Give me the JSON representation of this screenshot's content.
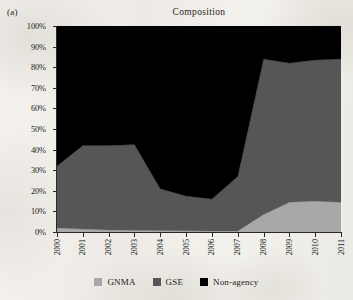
{
  "panel": {
    "label": "(a)"
  },
  "title": "Composition",
  "legend": {
    "items": [
      {
        "label": "GNMA",
        "color": "#a8a8a8",
        "swatch_name": "gnma-swatch"
      },
      {
        "label": "GSE",
        "color": "#565656",
        "swatch_name": "gse-swatch"
      },
      {
        "label": "Non-agency",
        "color": "#000000",
        "swatch_name": "non-agency-swatch"
      }
    ]
  },
  "axes": {
    "y": {
      "ticks": [
        "0%",
        "10%",
        "20%",
        "30%",
        "40%",
        "50%",
        "60%",
        "70%",
        "80%",
        "90%",
        "100%"
      ],
      "min": 0,
      "max": 100
    },
    "x": {
      "ticks": [
        "2000",
        "2001",
        "2002",
        "2003",
        "2004",
        "2005",
        "2006",
        "2007",
        "2008",
        "2009",
        "2010",
        "2011"
      ]
    }
  },
  "chart_data": {
    "type": "area",
    "stacked": true,
    "normalized": true,
    "title": "Composition",
    "xlabel": "",
    "ylabel": "",
    "ylim": [
      0,
      100
    ],
    "grid": false,
    "legend_position": "bottom",
    "x": [
      2000,
      2001,
      2002,
      2003,
      2004,
      2005,
      2006,
      2007,
      2008,
      2009,
      2010,
      2011
    ],
    "categories": [
      "2000",
      "2001",
      "2002",
      "2003",
      "2004",
      "2005",
      "2006",
      "2007",
      "2008",
      "2009",
      "2010",
      "2011"
    ],
    "series": [
      {
        "name": "GNMA",
        "color": "#a8a8a8",
        "values": [
          2.0,
          1.5,
          1.0,
          0.8,
          0.7,
          0.6,
          0.5,
          0.5,
          8.5,
          14.5,
          15.0,
          14.5
        ]
      },
      {
        "name": "GSE",
        "color": "#565656",
        "values": [
          30.0,
          40.5,
          41.0,
          41.7,
          20.3,
          16.9,
          15.5,
          26.5,
          75.5,
          67.5,
          68.5,
          69.5
        ]
      },
      {
        "name": "Non-agency",
        "color": "#000000",
        "values": [
          68.0,
          58.0,
          58.0,
          57.5,
          79.0,
          82.5,
          84.0,
          73.0,
          16.0,
          18.0,
          16.5,
          16.0
        ]
      }
    ],
    "cumulative_upper_bounds": {
      "GNMA": [
        2.0,
        1.5,
        1.0,
        0.8,
        0.7,
        0.6,
        0.5,
        0.5,
        8.5,
        14.5,
        15.0,
        14.5
      ],
      "GNMA_GSE": [
        32.0,
        42.0,
        42.0,
        42.5,
        21.0,
        17.5,
        16.0,
        27.0,
        84.0,
        82.0,
        83.5,
        84.0
      ],
      "total": [
        100,
        100,
        100,
        100,
        100,
        100,
        100,
        100,
        100,
        100,
        100,
        100
      ]
    }
  }
}
